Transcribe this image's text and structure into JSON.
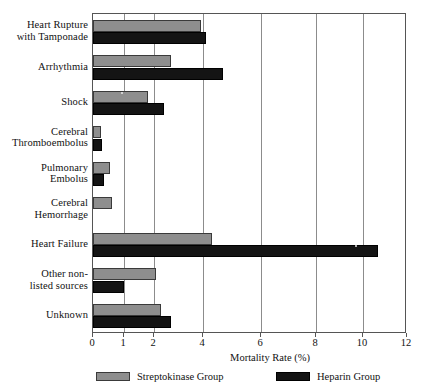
{
  "chart_data": {
    "type": "bar",
    "orientation": "horizontal",
    "title": "",
    "xlabel": "Mortality Rate (%)",
    "ylabel": "",
    "xlim": [
      0,
      12
    ],
    "xticks": [
      0,
      1,
      2,
      4,
      6,
      8,
      10,
      12
    ],
    "xticklabels": [
      "0",
      "1",
      "2",
      "4",
      "6",
      "8",
      "10",
      "12"
    ],
    "grid": true,
    "legend_position": "bottom",
    "categories": [
      "Heart Rupture with Tamponade",
      "Arrhythmia",
      "Shock",
      "Cerebral Thromboembolus",
      "Pulmonary Embolus",
      "Cerebral Hemorrhage",
      "Heart Failure",
      "Other non-listed sources",
      "Unknown"
    ],
    "category_label_lines": [
      [
        "Heart Rupture",
        "with Tamponade"
      ],
      [
        "Arrhythmia"
      ],
      [
        "Shock"
      ],
      [
        "Cerebral",
        "Thromboembolus"
      ],
      [
        "Pulmonary",
        "Embolus"
      ],
      [
        "Cerebral",
        "Hemorrhage"
      ],
      [
        "Heart Failure"
      ],
      [
        "Other non-",
        "listed sources"
      ],
      [
        "Unknown"
      ]
    ],
    "series": [
      {
        "name": "Streptokinase Group",
        "color": "#8e8e8e",
        "values": [
          3.9,
          2.7,
          1.8,
          0.25,
          0.55,
          0.6,
          4.3,
          2.1,
          2.3
        ]
      },
      {
        "name": "Heparin Group",
        "color": "#141414",
        "values": [
          4.1,
          4.7,
          2.4,
          0.3,
          0.35,
          0.0,
          10.7,
          1.0,
          2.7
        ]
      }
    ]
  },
  "axis": {
    "x_title": "Mortality Rate (%)"
  },
  "legend": {
    "items": [
      {
        "label": "Streptokinase Group",
        "swatch": "gray-swatch"
      },
      {
        "label": "Heparin Group",
        "swatch": "black-swatch"
      }
    ]
  }
}
